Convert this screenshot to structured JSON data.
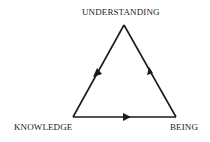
{
  "diagram": {
    "type": "cycle-triangle",
    "nodes": [
      {
        "id": "understanding",
        "label": "UNDERSTANDING",
        "position": "top"
      },
      {
        "id": "knowledge",
        "label": "KNOWLEDGE",
        "position": "bottom-left"
      },
      {
        "id": "being",
        "label": "BEING",
        "position": "bottom-right"
      }
    ],
    "edges": [
      {
        "from": "understanding",
        "to": "knowledge"
      },
      {
        "from": "knowledge",
        "to": "being"
      },
      {
        "from": "being",
        "to": "understanding"
      }
    ],
    "colors": {
      "line": "#1a1a1a",
      "background": "#ffffff"
    }
  }
}
